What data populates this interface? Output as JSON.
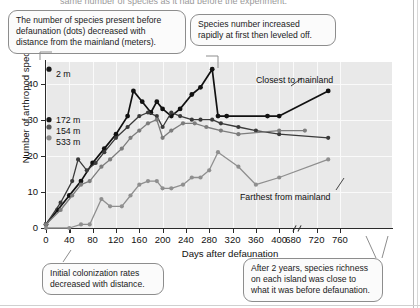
{
  "page": {
    "cut_top_caption": "same number of species as it had before the experiment."
  },
  "callouts": [
    {
      "id": "callout-before-defaunation",
      "lines": [
        "The number of species present before",
        "defaunation (dots) decreased with",
        "distance from the mainland (meters)."
      ]
    },
    {
      "id": "callout-rapid-increase",
      "lines": [
        "Species number increased",
        "rapidly at first then leveled off."
      ]
    },
    {
      "id": "callout-initial-colonization",
      "lines": [
        "Initial colonization rates",
        "decreased with distance."
      ]
    },
    {
      "id": "callout-after-two-years",
      "lines": [
        "After 2 years, species richness",
        "on each island was close to",
        "what it was before defaunation."
      ]
    }
  ],
  "chart_data": {
    "type": "line",
    "title": "",
    "xlabel": "Days after defaunation",
    "ylabel": "Number of arthropod species",
    "xlim": [
      0,
      780
    ],
    "ylim": [
      0,
      46
    ],
    "grid": true,
    "axis_break": {
      "after": 400,
      "before": 680
    },
    "xticks": [
      0,
      40,
      80,
      120,
      160,
      200,
      240,
      280,
      320,
      360,
      400,
      680,
      720,
      760
    ],
    "yticks": [
      0,
      10,
      20,
      30,
      40
    ],
    "legend_position": "inline-annotations",
    "annotations": [
      {
        "name": "closest-to-mainland",
        "text": "Closest to mainland"
      },
      {
        "name": "farthest-from-mainland",
        "text": "Farthest from mainland"
      }
    ],
    "pre_defaunation_markers": [
      {
        "label": "2 m",
        "value": 44,
        "color": "#1a1a1a"
      },
      {
        "label": "172 m",
        "value": 30,
        "color": "#1a1a1a"
      },
      {
        "label": "154 m",
        "value": 28,
        "color": "#555555"
      },
      {
        "label": "533 m",
        "value": 25,
        "color": "#8a8a8a"
      }
    ],
    "series": [
      {
        "name": "2 m",
        "color": "#111111",
        "points": [
          [
            0,
            1
          ],
          [
            20,
            5
          ],
          [
            40,
            9
          ],
          [
            60,
            13
          ],
          [
            80,
            18
          ],
          [
            100,
            22
          ],
          [
            120,
            26
          ],
          [
            140,
            31
          ],
          [
            150,
            38
          ],
          [
            165,
            35
          ],
          [
            180,
            32
          ],
          [
            190,
            35
          ],
          [
            200,
            33
          ],
          [
            215,
            31
          ],
          [
            230,
            33
          ],
          [
            250,
            37
          ],
          [
            265,
            39
          ],
          [
            285,
            44
          ],
          [
            295,
            31
          ],
          [
            310,
            31
          ],
          [
            380,
            31
          ],
          [
            400,
            31
          ],
          [
            740,
            38
          ]
        ]
      },
      {
        "name": "172 m",
        "color": "#3a3a3a",
        "points": [
          [
            0,
            1
          ],
          [
            25,
            7
          ],
          [
            45,
            13
          ],
          [
            55,
            19
          ],
          [
            70,
            16
          ],
          [
            85,
            18
          ],
          [
            100,
            21
          ],
          [
            120,
            25
          ],
          [
            140,
            28
          ],
          [
            160,
            31
          ],
          [
            175,
            32
          ],
          [
            190,
            31
          ],
          [
            200,
            28
          ],
          [
            215,
            32
          ],
          [
            230,
            31
          ],
          [
            250,
            30
          ],
          [
            265,
            30
          ],
          [
            285,
            30
          ],
          [
            300,
            29
          ],
          [
            330,
            28
          ],
          [
            360,
            27
          ],
          [
            400,
            26
          ],
          [
            740,
            25
          ]
        ]
      },
      {
        "name": "154 m",
        "color": "#7d7d7d",
        "points": [
          [
            0,
            1
          ],
          [
            25,
            5
          ],
          [
            45,
            9
          ],
          [
            60,
            12
          ],
          [
            75,
            13
          ],
          [
            95,
            17
          ],
          [
            110,
            19
          ],
          [
            130,
            22
          ],
          [
            145,
            25
          ],
          [
            160,
            27
          ],
          [
            175,
            29
          ],
          [
            190,
            30
          ],
          [
            200,
            25
          ],
          [
            215,
            27
          ],
          [
            235,
            29
          ],
          [
            255,
            29
          ],
          [
            275,
            28
          ],
          [
            300,
            27
          ],
          [
            330,
            26
          ],
          [
            400,
            27
          ],
          [
            700,
            27
          ]
        ]
      },
      {
        "name": "533 m",
        "color": "#8f8f8f",
        "points": [
          [
            0,
            0
          ],
          [
            40,
            0
          ],
          [
            60,
            1
          ],
          [
            75,
            1
          ],
          [
            95,
            8
          ],
          [
            110,
            6
          ],
          [
            130,
            6
          ],
          [
            145,
            9
          ],
          [
            160,
            12
          ],
          [
            175,
            13
          ],
          [
            190,
            13
          ],
          [
            200,
            11
          ],
          [
            215,
            11
          ],
          [
            235,
            12
          ],
          [
            250,
            14
          ],
          [
            265,
            14
          ],
          [
            280,
            16
          ],
          [
            295,
            21
          ],
          [
            330,
            17
          ],
          [
            360,
            12
          ],
          [
            400,
            14
          ],
          [
            740,
            19
          ]
        ]
      }
    ]
  }
}
